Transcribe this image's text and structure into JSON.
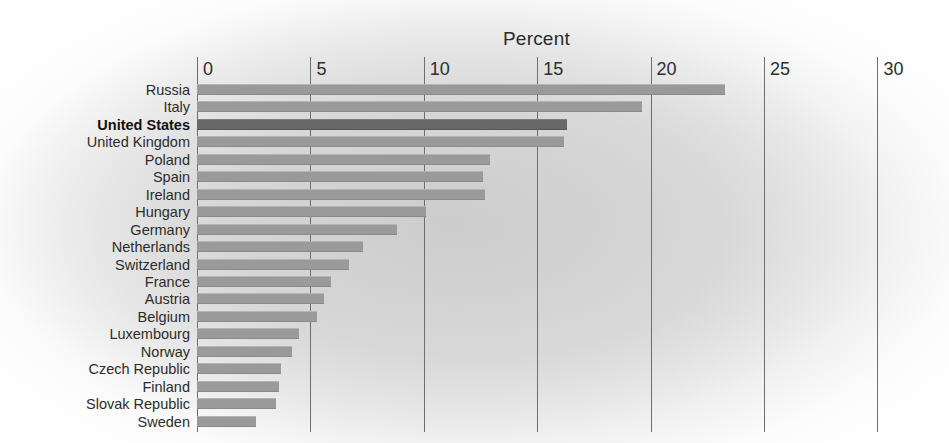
{
  "chart_data": {
    "type": "bar",
    "orientation": "horizontal",
    "title": "Percent",
    "xlabel": "Percent",
    "ylabel": "",
    "xlim": [
      0,
      30
    ],
    "xticks": [
      0,
      5,
      10,
      15,
      20,
      25,
      30
    ],
    "xtick_labels": [
      "0",
      "5",
      "10",
      "15",
      "20",
      "25",
      "30"
    ],
    "grid": true,
    "legend": "none",
    "highlight_category": "United States",
    "colors": {
      "bar": "#9a9a9a",
      "bar_highlight": "#686868",
      "gridline": "#6e6e6e",
      "text": "#2c2c2c",
      "background": "#d6d6d6"
    },
    "categories": [
      "Russia",
      "Italy",
      "United States",
      "United Kingdom",
      "Poland",
      "Spain",
      "Ireland",
      "Hungary",
      "Germany",
      "Netherlands",
      "Switzerland",
      "France",
      "Austria",
      "Belgium",
      "Luxembourg",
      "Norway",
      "Czech Republic",
      "Finland",
      "Slovak Republic",
      "Sweden"
    ],
    "values": [
      23.3,
      19.6,
      16.3,
      16.2,
      12.9,
      12.6,
      12.7,
      10.1,
      8.8,
      7.3,
      6.7,
      5.9,
      5.6,
      5.3,
      4.5,
      4.2,
      3.7,
      3.6,
      3.5,
      2.6
    ]
  }
}
